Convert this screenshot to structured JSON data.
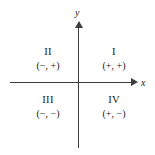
{
  "figure": {
    "background_color": "#ffffff",
    "line_color": "#3d3d3d",
    "text_color": "#1a1a1a"
  },
  "axes": {
    "x": {
      "label": "x",
      "arrow_direction": "right"
    },
    "y": {
      "label": "y",
      "arrow_direction": "up"
    },
    "origin": {
      "x": 78,
      "y": 82
    }
  },
  "quadrants": [
    {
      "id": "I",
      "numeral": "I",
      "signs": "(+, +)",
      "x_sign": "+",
      "y_sign": "+",
      "position": "top-right"
    },
    {
      "id": "II",
      "numeral": "II",
      "signs": "(−, +)",
      "x_sign": "−",
      "y_sign": "+",
      "position": "top-left"
    },
    {
      "id": "III",
      "numeral": "III",
      "signs": "(−, −)",
      "x_sign": "−",
      "y_sign": "−",
      "position": "bottom-left"
    },
    {
      "id": "IV",
      "numeral": "IV",
      "signs": "(+, −)",
      "x_sign": "+",
      "y_sign": "−",
      "position": "bottom-right"
    }
  ],
  "chart_data": {
    "type": "diagram",
    "title": "",
    "xlabel": "x",
    "ylabel": "y",
    "grid": false,
    "legend": "none",
    "annotations": [
      {
        "text": "II",
        "quadrant": "II",
        "role": "numeral"
      },
      {
        "text": "(−, +)",
        "quadrant": "II",
        "role": "signs"
      },
      {
        "text": "I",
        "quadrant": "I",
        "role": "numeral"
      },
      {
        "text": "(+, +)",
        "quadrant": "I",
        "role": "signs"
      },
      {
        "text": "III",
        "quadrant": "III",
        "role": "numeral"
      },
      {
        "text": "(−, −)",
        "quadrant": "III",
        "role": "signs"
      },
      {
        "text": "IV",
        "quadrant": "IV",
        "role": "numeral"
      },
      {
        "text": "(+, −)",
        "quadrant": "IV",
        "role": "signs"
      }
    ]
  }
}
